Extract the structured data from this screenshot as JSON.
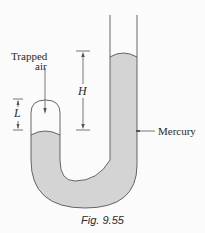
{
  "figure": {
    "caption": "Fig. 9.55",
    "colors": {
      "background": "#fbfbfb",
      "mercury_fill": "#d4d4d4",
      "outline": "#555555",
      "text": "#2a2a2a"
    },
    "labels": {
      "trapped_air_line1": "Trapped",
      "trapped_air_line2": "air",
      "height_label": "H",
      "length_label": "L",
      "mercury_label": "Mercury"
    }
  }
}
